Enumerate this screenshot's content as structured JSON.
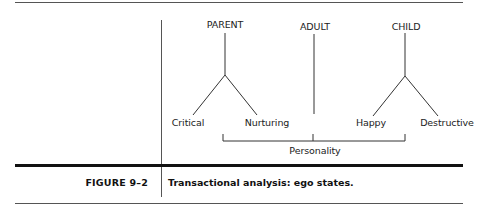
{
  "diagram": {
    "nodes": {
      "parent": {
        "label": "PARENT",
        "children": [
          "Critical",
          "Nurturing"
        ]
      },
      "adult": {
        "label": "ADULT"
      },
      "child": {
        "label": "CHILD",
        "children": [
          "Happy",
          "Destructive"
        ]
      }
    },
    "leaves": {
      "critical": "Critical",
      "nurturing": "Nurturing",
      "happy": "Happy",
      "destructive": "Destructive"
    },
    "bracket_label": "Personality",
    "line_color": "#333333"
  },
  "caption": {
    "number": "FIGURE 9–2",
    "text": "Transactional analysis: ego states."
  }
}
